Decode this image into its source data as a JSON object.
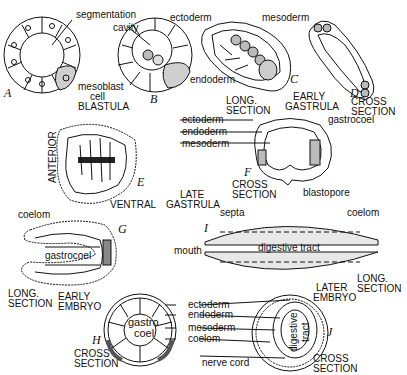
{
  "figure": {
    "panels": {
      "A": {
        "letter": "A"
      },
      "B": {
        "letter": "B"
      },
      "C": {
        "letter": "C"
      },
      "D": {
        "letter": "D"
      },
      "E": {
        "letter": "E"
      },
      "F": {
        "letter": "F"
      },
      "G": {
        "letter": "G"
      },
      "H": {
        "letter": "H"
      },
      "I": {
        "letter": "I"
      },
      "J": {
        "letter": "J"
      }
    },
    "labels": {
      "segmentation_cavity_1": "segmentation",
      "segmentation_cavity_2": "cavity",
      "mesoblast_cell_1": "mesoblast",
      "mesoblast_cell_2": "cell",
      "blastula": "BLASTULA",
      "ectoderm_c": "ectoderm",
      "mesoderm_c": "mesoderm",
      "endoderm_c": "endoderm",
      "long_section_c_1": "LONG.",
      "long_section_c_2": "SECTION",
      "early_gastrula_1": "EARLY",
      "early_gastrula_2": "GASTRULA",
      "cross_section_d_1": "CROSS",
      "cross_section_d_2": "SECTION",
      "ectoderm_e": "ectoderm",
      "endoderm_e": "endoderm",
      "mesoderm_e": "mesoderm",
      "anterior": "ANTERIOR",
      "ventral": "VENTRAL",
      "late_gastrula_1": "LATE",
      "late_gastrula_2": "GASTRULA",
      "gastrocoel_f": "gastrocoel",
      "cross_section_f_1": "CROSS",
      "cross_section_f_2": "SECTION",
      "blastopore": "blastopore",
      "coelom_g": "coelom",
      "gastrocoel_g": "gastrocoel",
      "long_section_g_1": "LONG.",
      "long_section_g_2": "SECTION",
      "early_embryo_1": "EARLY",
      "early_embryo_2": "EMBRYO",
      "septa": "septa",
      "coelom_i": "coelom",
      "mouth": "mouth",
      "digestive_tract_i": "digestive tract",
      "later_embryo_1": "LATER",
      "later_embryo_2": "EMBRYO",
      "long_section_i_1": "LONG.",
      "long_section_i_2": "SECTION",
      "gastro_coel_h_1": "gastro",
      "gastro_coel_h_2": "coel",
      "cross_section_h_1": "CROSS",
      "cross_section_h_2": "SECTION",
      "ectoderm_j": "ectoderm",
      "endoderm_j": "endoderm",
      "mesoderm_j": "mesoderm",
      "coelom_j": "coelom",
      "nerve_cord": "nerve cord",
      "digestive_tract_j_1": "digestive",
      "digestive_tract_j_2": "tract",
      "cross_section_j_1": "CROSS",
      "cross_section_j_2": "SECTION"
    }
  }
}
